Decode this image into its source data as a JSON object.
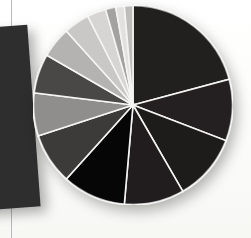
{
  "figure": {
    "kind": "pie-chart-photo",
    "background_color": "#fdfdfb",
    "separator_color": "#f4f4f2"
  },
  "decor": {
    "left_rule": {
      "name": "vertical-rule",
      "color": "#b9b9b9"
    },
    "left_slab": {
      "name": "dark-slab",
      "color": "#2e2e2e",
      "rotation_deg": -4.2
    }
  },
  "chart_data": {
    "type": "pie",
    "title": "",
    "subtitle": "",
    "xlabel": "",
    "ylabel": "",
    "legend": "none",
    "grid": false,
    "start_angle_deg": 0,
    "direction": "clockwise",
    "center": {
      "x": 100,
      "y": 100
    },
    "radius": 100,
    "total": 100,
    "labels": [
      "Segment 1",
      "Segment 2",
      "Segment 3",
      "Segment 4",
      "Segment 5",
      "Segment 6",
      "Segment 7",
      "Segment 8",
      "Segment 9",
      "Segment 10",
      "Segment 11",
      "Segment 12",
      "Segment 13",
      "Segment 14"
    ],
    "values": [
      20.8,
      10.0,
      10.8,
      9.7,
      10.3,
      8.3,
      6.9,
      6.4,
      5.0,
      4.2,
      3.1,
      1.7,
      1.4,
      1.4
    ],
    "angles_deg": [
      75,
      36,
      39,
      35,
      37,
      30,
      25,
      23,
      18,
      15,
      11,
      6,
      5,
      5
    ],
    "colors": [
      "#221f1f",
      "#241f20",
      "#1e1b1b",
      "#211d1e",
      "#070606",
      "#3d3a3a",
      "#8f8e8d",
      "#4a4747",
      "#b4b3b1",
      "#c9c8c6",
      "#d6d5d3",
      "#a3a2a0",
      "#e2e1df",
      "#bdbcba"
    ]
  }
}
